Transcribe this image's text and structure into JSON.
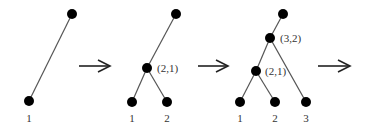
{
  "diagram": {
    "type": "tree-merge-sequence",
    "colors": {
      "node": "#000000",
      "edge": "#555555",
      "text": "#333333"
    },
    "stages": [
      {
        "nodes": [
          {
            "id": "root",
            "x": 72,
            "y": 14
          },
          {
            "id": "leaf1",
            "x": 29,
            "y": 101,
            "label": "1"
          }
        ],
        "edges": [
          [
            "root",
            "leaf1"
          ]
        ],
        "internal_labels": []
      },
      {
        "nodes": [
          {
            "id": "root",
            "x": 176,
            "y": 14
          },
          {
            "id": "n21",
            "x": 147,
            "y": 68,
            "label": "(2,1)"
          },
          {
            "id": "leaf1",
            "x": 132,
            "y": 102,
            "label": "1"
          },
          {
            "id": "leaf2",
            "x": 167,
            "y": 102,
            "label": "2"
          }
        ],
        "edges": [
          [
            "root",
            "n21"
          ],
          [
            "n21",
            "leaf1"
          ],
          [
            "n21",
            "leaf2"
          ]
        ]
      },
      {
        "nodes": [
          {
            "id": "root",
            "x": 283,
            "y": 14
          },
          {
            "id": "n32",
            "x": 270,
            "y": 38,
            "label": "(3,2)"
          },
          {
            "id": "n21",
            "x": 256,
            "y": 71,
            "label": "(2,1)"
          },
          {
            "id": "leaf1",
            "x": 240,
            "y": 102,
            "label": "1"
          },
          {
            "id": "leaf2",
            "x": 275,
            "y": 102,
            "label": "2"
          },
          {
            "id": "leaf3",
            "x": 306,
            "y": 102,
            "label": "3"
          }
        ],
        "edges": [
          [
            "root",
            "n32"
          ],
          [
            "n32",
            "n21"
          ],
          [
            "n32",
            "leaf3"
          ],
          [
            "n21",
            "leaf1"
          ],
          [
            "n21",
            "leaf2"
          ]
        ]
      }
    ],
    "arrows": [
      {
        "x1": 79,
        "x2": 110,
        "y": 66
      },
      {
        "x1": 198,
        "x2": 228,
        "y": 66
      },
      {
        "x1": 318,
        "x2": 350,
        "y": 66
      }
    ],
    "labels": {
      "s1_leaf1": "1",
      "s2_n21": "(2,1)",
      "s2_leaf1": "1",
      "s2_leaf2": "2",
      "s3_n32": "(3,2)",
      "s3_n21": "(2,1)",
      "s3_leaf1": "1",
      "s3_leaf2": "2",
      "s3_leaf3": "3"
    }
  }
}
